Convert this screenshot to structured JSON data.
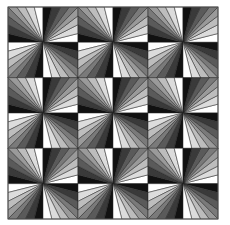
{
  "quilt": {
    "origin": [
      8,
      7
    ],
    "size": [
      210,
      212
    ],
    "rows": 6,
    "cols": 6,
    "wedges": 8,
    "stroke": "#222222",
    "border": "#555555",
    "shades": [
      "#111111",
      "#3a3a3a",
      "#5a5a5a",
      "#7a7a7a",
      "#9a9a9a",
      "#bdbdbd",
      "#dcdcdc",
      "#ffffff"
    ]
  }
}
